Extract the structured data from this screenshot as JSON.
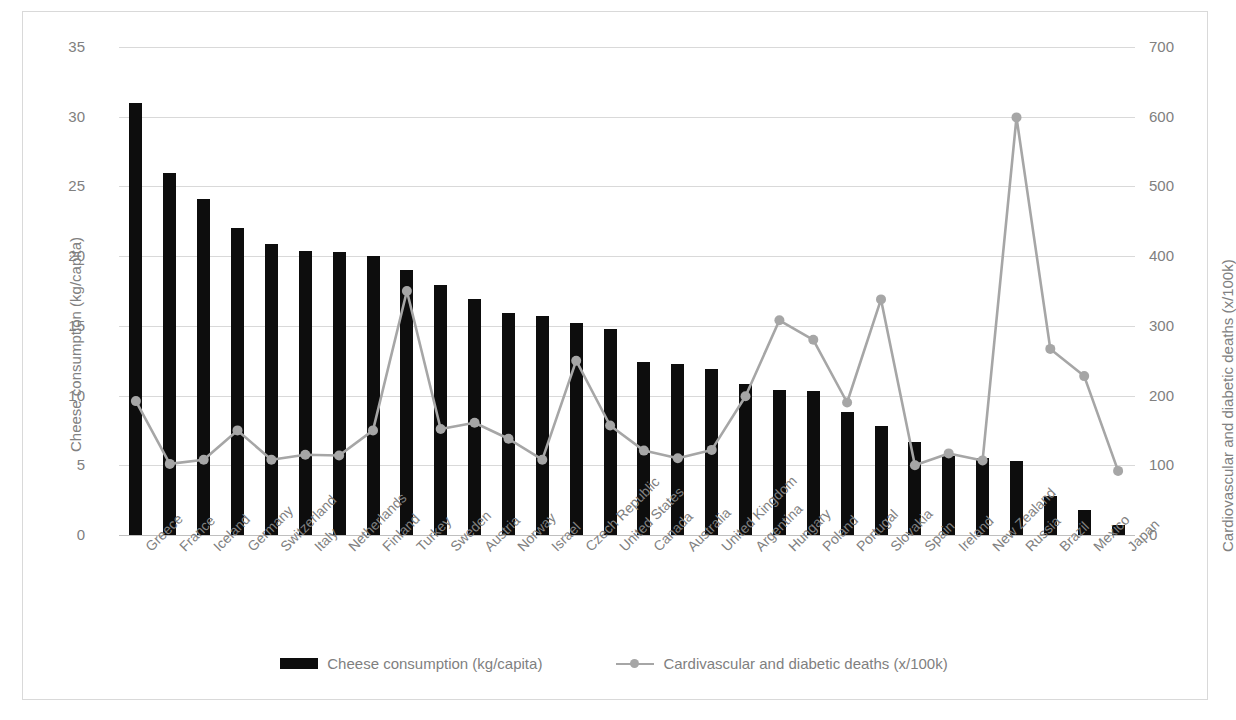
{
  "chart_data": {
    "type": "bar",
    "title": "",
    "subtitle": "",
    "categories": [
      "Greece",
      "France",
      "Iceland",
      "Germany",
      "Switzerland",
      "Italy",
      "Netherlands",
      "Finland",
      "Turkey",
      "Sweden",
      "Austria",
      "Norway",
      "Israel",
      "Czech Republic",
      "United States",
      "Canada",
      "Australia",
      "United Kingdom",
      "Argentina",
      "Hungary",
      "Poland",
      "Portugal",
      "Slovakia",
      "Spain",
      "Ireland",
      "New Zealand",
      "Russia",
      "Brazil",
      "Mexico",
      "Japan"
    ],
    "series": [
      {
        "name": "Cheese consumption (kg/capita)",
        "type": "bar",
        "axis": "left",
        "color": "#0d0d0d",
        "values": [
          31.0,
          26.0,
          24.1,
          22.0,
          20.9,
          20.4,
          20.3,
          20.0,
          19.0,
          17.9,
          16.9,
          15.9,
          15.7,
          15.2,
          14.8,
          12.4,
          12.3,
          11.9,
          10.8,
          10.4,
          10.3,
          8.8,
          7.8,
          6.7,
          5.7,
          5.5,
          5.3,
          2.8,
          1.8,
          0.7
        ]
      },
      {
        "name": "Cardivascular and diabetic deaths (x/100k)",
        "type": "line",
        "axis": "right",
        "color": "#a6a6a6",
        "values": [
          192,
          102,
          108,
          150,
          108,
          115,
          114,
          150,
          350,
          152,
          161,
          138,
          108,
          250,
          157,
          121,
          110,
          122,
          199,
          308,
          280,
          190,
          338,
          100,
          117,
          107,
          599,
          267,
          228,
          92
        ]
      }
    ],
    "xlabel": "",
    "ylabel_left": "Cheese consumption (kg/capita)",
    "ylabel_right": "Cardiovascular and diabetic deaths (x/100k)",
    "ylim_left": [
      0,
      35
    ],
    "ylim_right": [
      0,
      700
    ],
    "yticks_left": [
      "0",
      "5",
      "10",
      "15",
      "20",
      "25",
      "30",
      "35"
    ],
    "yticks_right": [
      "0",
      "100",
      "200",
      "300",
      "400",
      "500",
      "600",
      "700"
    ],
    "grid": true,
    "legend_position": "bottom"
  },
  "axes": {
    "left_title": "Cheese consumption (kg/capita)",
    "right_title": "Cardiovascular and diabetic deaths (x/100k)"
  },
  "legend": {
    "entries": [
      {
        "label": "Cheese consumption (kg/capita)",
        "marker": "bar-swatch"
      },
      {
        "label": "Cardivascular and diabetic deaths (x/100k)",
        "marker": "line-marker-swatch"
      }
    ]
  },
  "colors": {
    "bar": "#0d0d0d",
    "line": "#a6a6a6",
    "grid": "#d9d9d9",
    "text": "#808080",
    "frame": "#d9d9d9"
  }
}
